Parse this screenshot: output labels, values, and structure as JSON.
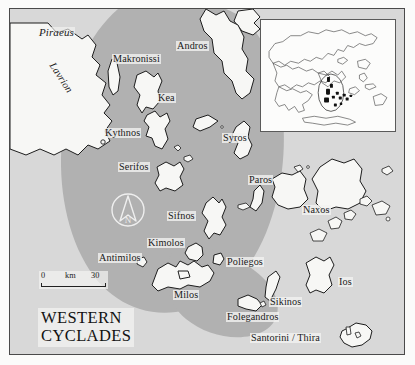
{
  "map": {
    "title_line1": "WESTERN",
    "title_line2": "CYCLADES",
    "sea_color": "#d8d8d8",
    "highlight_color": "#b1b1b1",
    "land_color": "#f7f7f5",
    "outline_color": "#1d1d1d",
    "frame_color": "#4a4a4a"
  },
  "scale": {
    "zero": "0",
    "unit": "km",
    "max": "30"
  },
  "compass": {
    "letter": "N",
    "name": "north-arrow"
  },
  "inset": {
    "name": "greece-inset-map",
    "description": "Greece overview with Western Cyclades highlighted"
  },
  "labels": {
    "mainland": [
      {
        "id": "piraeus",
        "text": "Piraeus",
        "style": "italic"
      },
      {
        "id": "lavrion",
        "text": "Lavrion",
        "style": "rotated-italic"
      }
    ],
    "islands": [
      {
        "id": "makronissi",
        "text": "Makronissi"
      },
      {
        "id": "kea",
        "text": "Kea"
      },
      {
        "id": "kythnos",
        "text": "Kythnos"
      },
      {
        "id": "serifos",
        "text": "Serifos"
      },
      {
        "id": "sifnos",
        "text": "Sifnos"
      },
      {
        "id": "kimolos",
        "text": "Kimolos"
      },
      {
        "id": "antimilos",
        "text": "Antimilos"
      },
      {
        "id": "poliegos",
        "text": "Poliegos"
      },
      {
        "id": "milos",
        "text": "Milos"
      },
      {
        "id": "folegandros",
        "text": "Folegandros"
      },
      {
        "id": "sikinos",
        "text": "Sikinos"
      },
      {
        "id": "ios",
        "text": "Ios"
      },
      {
        "id": "santorini",
        "text": "Santorini / Thira"
      },
      {
        "id": "andros",
        "text": "Andros"
      },
      {
        "id": "syros",
        "text": "Syros"
      },
      {
        "id": "paros",
        "text": "Paros"
      },
      {
        "id": "naxos",
        "text": "Naxos"
      }
    ]
  }
}
